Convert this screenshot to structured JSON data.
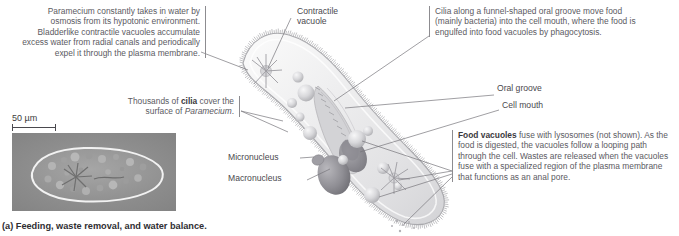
{
  "figure": {
    "caption": "(a) Feeding, waste removal, and water balance.",
    "organism": "Paramecium",
    "scale_bar": {
      "value": "50 µm"
    }
  },
  "annotations": {
    "water_balance": {
      "name": "water-balance-note",
      "text": "Paramecium constantly takes in water by osmosis from its hypotonic environment. Bladderlike contractile vacuoles accumulate excess water from radial canals and periodically expel it through the plasma membrane.",
      "italic_lead": "Paramecium"
    },
    "cilia_note": {
      "name": "cilia-note",
      "prefix": "Thousands of ",
      "bold": "cilia",
      "middle": " cover the surface of ",
      "italic_tail": "Paramecium",
      "suffix": "."
    },
    "feeding": {
      "name": "feeding-note",
      "text": "Cilia along a funnel-shaped oral groove move food (mainly bacteria) into the cell mouth, where the food is engulfed into food vacuoles by phagocytosis."
    },
    "food_vacuoles": {
      "name": "food-vacuole-note",
      "bold": "Food vacuoles",
      "text": " fuse with lysosomes (not shown). As the food is digested, the vacuoles follow a looping path through the cell. Wastes are released when the vacuoles fuse with a specialized region of the plasma membrane that functions as an anal pore."
    }
  },
  "labels": {
    "contractile_vacuole": "Contractile\nvacuole",
    "contractile_vacuole_line1": "Contractile",
    "contractile_vacuole_line2": "vacuole",
    "oral_groove": "Oral groove",
    "cell_mouth": "Cell mouth",
    "micronucleus": "Micronucleus",
    "macronucleus": "Macronucleus"
  },
  "colors": {
    "text": "#5b5a5f",
    "label": "#4a494e",
    "leader": "#6e6d72",
    "rule": "#8d8c90",
    "cell_fill": "#e9e9ea",
    "cell_edge": "#b9b9bb",
    "vacuole": "#c9c9cc",
    "nucleus": "#8e8d92",
    "micrograph": "#8e8e8e",
    "caption": "#2f2e32"
  }
}
